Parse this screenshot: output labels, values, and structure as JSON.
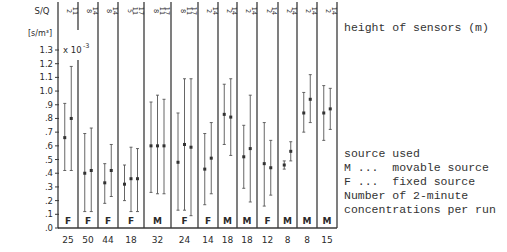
{
  "chart_data": {
    "type": "errorbar",
    "title": "",
    "ylabel": "S/Q",
    "yunit": "[s/m³]",
    "yscale_note": "x 10^-3",
    "ylim": [
      0,
      1.3
    ],
    "yticks": [
      "1.3",
      "1.2",
      "1.1",
      "1.0",
      ".9",
      ".8",
      ".7",
      ".6",
      ".5",
      ".4",
      ".3",
      ".2",
      ".1",
      ".0"
    ],
    "groups": [
      {
        "n": "25",
        "source": "F",
        "heights": [
          "2",
          "11"
        ],
        "bars": [
          {
            "top": 0.91,
            "mean": 0.66,
            "bottom": 0.42
          },
          {
            "top": 1.18,
            "mean": 0.8,
            "bottom": 0.42
          }
        ]
      },
      {
        "n": "50",
        "source": "F",
        "heights": [
          "8",
          "14"
        ],
        "bars": [
          {
            "top": 0.69,
            "mean": 0.4,
            "bottom": 0.12
          },
          {
            "top": 0.73,
            "mean": 0.42,
            "bottom": 0.12
          }
        ]
      },
      {
        "n": "44",
        "source": "F",
        "heights": [
          "8",
          "14"
        ],
        "bars": [
          {
            "top": 0.47,
            "mean": 0.33,
            "bottom": 0.18
          },
          {
            "top": 0.61,
            "mean": 0.42,
            "bottom": 0.23
          }
        ]
      },
      {
        "n": "18",
        "source": "F",
        "heights": [
          "5",
          "11",
          "17"
        ],
        "bars": [
          {
            "top": 0.46,
            "mean": 0.32,
            "bottom": 0.2
          },
          {
            "top": 0.59,
            "mean": 0.36,
            "bottom": 0.12
          },
          {
            "top": 0.58,
            "mean": 0.36,
            "bottom": 0.12
          }
        ]
      },
      {
        "n": "32",
        "source": "M",
        "heights": [
          "8",
          "11",
          "17"
        ],
        "bars": [
          {
            "top": 0.92,
            "mean": 0.6,
            "bottom": 0.26
          },
          {
            "top": 0.97,
            "mean": 0.6,
            "bottom": 0.25
          },
          {
            "top": 0.94,
            "mean": 0.6,
            "bottom": 0.25
          }
        ]
      },
      {
        "n": "24",
        "source": "F",
        "heights": [
          "8",
          "11",
          "17"
        ],
        "bars": [
          {
            "top": 0.84,
            "mean": 0.48,
            "bottom": 0.13
          },
          {
            "top": 1.09,
            "mean": 0.61,
            "bottom": 0.13
          },
          {
            "top": 1.09,
            "mean": 0.59,
            "bottom": 0.09
          }
        ]
      },
      {
        "n": "14",
        "source": "F",
        "heights": [
          "2",
          "14"
        ],
        "bars": [
          {
            "top": 0.69,
            "mean": 0.43,
            "bottom": 0.17
          },
          {
            "top": 0.77,
            "mean": 0.51,
            "bottom": 0.25
          }
        ]
      },
      {
        "n": "18",
        "source": "M",
        "heights": [
          "2",
          "14"
        ],
        "bars": [
          {
            "top": 1.05,
            "mean": 0.83,
            "bottom": 0.61
          },
          {
            "top": 1.09,
            "mean": 0.81,
            "bottom": 0.53
          }
        ]
      },
      {
        "n": "18",
        "source": "M",
        "heights": [
          "2",
          "14"
        ],
        "bars": [
          {
            "top": 0.75,
            "mean": 0.52,
            "bottom": 0.29
          },
          {
            "top": 0.97,
            "mean": 0.58,
            "bottom": 0.19
          }
        ]
      },
      {
        "n": "12",
        "source": "F",
        "heights": [
          "2",
          "14"
        ],
        "bars": [
          {
            "top": 0.77,
            "mean": 0.47,
            "bottom": 0.16
          },
          {
            "top": 0.64,
            "mean": 0.44,
            "bottom": 0.24
          }
        ]
      },
      {
        "n": "8",
        "source": "M",
        "heights": [
          "2",
          "14"
        ],
        "bars": [
          {
            "top": 0.49,
            "mean": 0.46,
            "bottom": 0.43
          },
          {
            "top": 0.63,
            "mean": 0.56,
            "bottom": 0.49
          }
        ]
      },
      {
        "n": "8",
        "source": "M",
        "heights": [
          "2",
          "14"
        ],
        "bars": [
          {
            "top": 0.99,
            "mean": 0.84,
            "bottom": 0.7
          },
          {
            "top": 1.12,
            "mean": 0.94,
            "bottom": 0.77
          }
        ]
      },
      {
        "n": "15",
        "source": "M",
        "heights": [
          "2",
          "14"
        ],
        "bars": [
          {
            "top": 1.04,
            "mean": 0.84,
            "bottom": 0.64
          },
          {
            "top": 1.02,
            "mean": 0.87,
            "bottom": 0.72
          }
        ]
      }
    ],
    "legend_position": "right"
  },
  "legend": {
    "heights_label": "height of sensors (m)",
    "source_title": "source used",
    "source_m": "M ...  movable source",
    "source_f": "F ...  fixed source",
    "number_line1": "Number of 2-minute",
    "number_line2": "concentrations per run"
  }
}
